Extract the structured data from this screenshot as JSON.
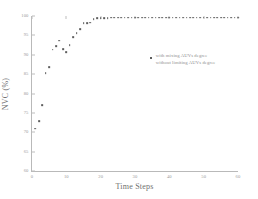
{
  "chart_data": {
    "type": "scatter",
    "title": "",
    "xlabel": "Time Steps",
    "ylabel": "NVC (%)",
    "xlim": [
      0,
      60
    ],
    "ylim": [
      60,
      100
    ],
    "grid": false,
    "legend_position": "upper right",
    "xticks": [
      0,
      10,
      20,
      30,
      40,
      50,
      60
    ],
    "yticks": [
      60,
      65,
      70,
      75,
      80,
      85,
      90,
      95,
      100
    ],
    "xtick_labels": [
      "0",
      "10",
      "20",
      "30",
      "40",
      "50",
      "60"
    ],
    "ytick_labels": [
      "60",
      "65",
      "70",
      "75",
      "80",
      "85",
      "90",
      "95",
      "100"
    ],
    "legend": [
      "with mixing AUVs degree",
      "without limiting AUVs degree"
    ],
    "marker_color": "#5d5d5d",
    "axis_color": "#b9b9b9",
    "series": [
      {
        "name": "with mixing AUVs degree",
        "x": [
          1,
          2,
          3,
          4,
          5,
          6,
          7,
          8,
          9,
          10,
          11,
          12,
          13,
          14,
          15,
          16,
          17,
          18,
          19,
          20,
          21,
          22,
          23,
          24,
          25,
          26,
          27,
          28,
          29,
          30,
          31,
          32,
          33,
          34,
          35,
          36,
          37,
          38,
          39,
          40,
          41,
          42,
          43,
          44,
          45,
          46,
          47,
          48,
          49,
          50,
          51,
          52,
          53,
          54,
          55,
          56,
          57,
          58,
          59,
          60
        ],
        "y": [
          70.9,
          72.8,
          77.0,
          85.3,
          86.8,
          91.3,
          92.2,
          93.6,
          91.5,
          90.7,
          92.4,
          94.6,
          95.5,
          96.6,
          98.2,
          98.1,
          98.3,
          99.2,
          99.4,
          99.5,
          99.5,
          99.5,
          99.6,
          99.6,
          99.6,
          99.6,
          99.6,
          99.6,
          99.6,
          99.6,
          99.6,
          99.6,
          99.6,
          99.6,
          99.6,
          99.6,
          99.6,
          99.6,
          99.6,
          99.6,
          99.6,
          99.6,
          99.6,
          99.6,
          99.6,
          99.6,
          99.6,
          99.6,
          99.6,
          99.6,
          99.6,
          99.6,
          99.6,
          99.6,
          99.6,
          99.6,
          99.6,
          99.6,
          99.6,
          99.6
        ]
      }
    ]
  }
}
